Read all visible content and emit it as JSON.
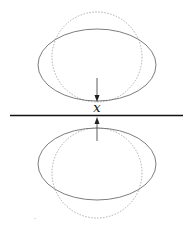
{
  "diagram": {
    "label": "x",
    "colors": {
      "ellipse": "#6e6e6e",
      "dotted_circle": "#9a9a9a",
      "line": "#111111",
      "arrow": "#222222",
      "background": "#ffffff"
    },
    "elements": [
      {
        "name": "upper-ellipse",
        "shape": "ellipse",
        "style": "solid"
      },
      {
        "name": "upper-dotted-circle",
        "shape": "circle",
        "style": "dotted"
      },
      {
        "name": "lower-ellipse",
        "shape": "ellipse",
        "style": "solid"
      },
      {
        "name": "lower-dotted-circle",
        "shape": "circle",
        "style": "dotted"
      },
      {
        "name": "horizontal-line",
        "shape": "line",
        "style": "solid"
      },
      {
        "name": "downward-arrow",
        "shape": "arrow",
        "direction": "down"
      },
      {
        "name": "upward-arrow",
        "shape": "arrow",
        "direction": "up"
      }
    ]
  }
}
